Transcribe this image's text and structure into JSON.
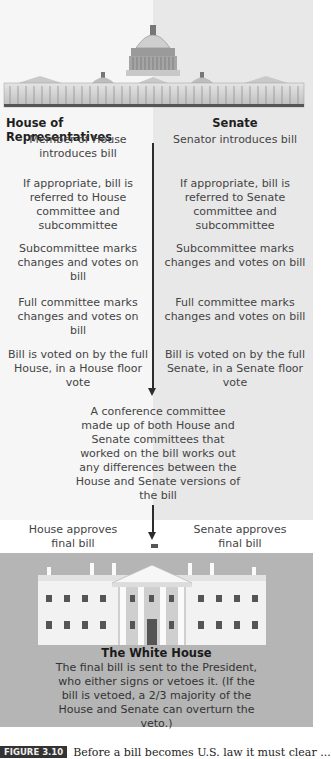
{
  "diagram": {
    "columns": {
      "house": {
        "title": "House of Representatives",
        "steps": [
          "Member of House introduces bill",
          "If appropriate, bill is referred to House committee and subcommittee",
          "Subcommittee marks changes and votes on bill",
          "Full committee marks changes and votes on bill",
          "Bill is voted on by the full House, in a House floor vote"
        ],
        "approval": "House approves final bill"
      },
      "senate": {
        "title": "Senate",
        "steps": [
          "Senator introduces bill",
          "If appropriate, bill is referred to Senate committee and subcommittee",
          "Subcommittee marks changes and votes on bill",
          "Full committee marks changes and votes on bill",
          "Bill is voted on by the full Senate, in a Senate floor vote"
        ],
        "approval": "Senate approves final bill"
      }
    },
    "conference": "A conference committee made up of both House and Senate committees that worked on the bill works out any differences between the House and Senate versions of the bill",
    "white_house": {
      "title": "The White House",
      "text": "The final bill is sent to the President, who either signs or vetoes it. (If the bill is vetoed, a 2/3 majority of the House and Senate can overturn the veto.)"
    },
    "images": {
      "top": "us-capitol-building-illustration",
      "bottom": "white-house-illustration"
    }
  },
  "caption": {
    "label": "FIGURE 3.10",
    "text": "Before a bill becomes U.S. law it must clear ..."
  },
  "colors": {
    "left_bg": "#f6f6f6",
    "right_bg": "#e8e8e8",
    "white_house_panel": "#b5b5b5",
    "arrow": "#2c2c2c"
  }
}
